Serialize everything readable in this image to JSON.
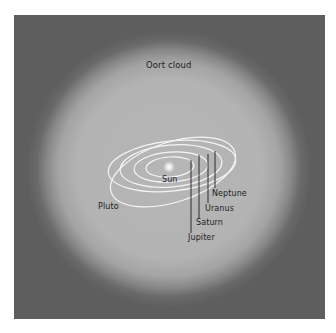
{
  "diagram": {
    "title_label": "Oort cloud",
    "center_label": "Sun",
    "planets": [
      {
        "name": "Jupiter"
      },
      {
        "name": "Saturn"
      },
      {
        "name": "Uranus"
      },
      {
        "name": "Neptune"
      },
      {
        "name": "Pluto"
      }
    ],
    "colors": {
      "background_outer": "#5e5e5e",
      "cloud": "#b5b5b5",
      "orbit_lines": "#ffffff",
      "leader_lines": "#1e1e1e",
      "text": "#1e1e1e",
      "page": "#ffffff"
    }
  }
}
